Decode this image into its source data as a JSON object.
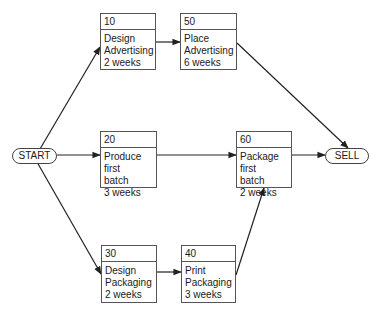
{
  "diagram": {
    "type": "PERT network",
    "start": "START",
    "end": "SELL",
    "activities": [
      {
        "id": "10",
        "name": "Design Advertising",
        "line1": "Design",
        "line2": "Advertising",
        "duration": "2 weeks"
      },
      {
        "id": "50",
        "name": "Place Advertising",
        "line1": "Place",
        "line2": "Advertising",
        "duration": "6 weeks"
      },
      {
        "id": "20",
        "name": "Produce first batch",
        "line1": "Produce first",
        "line2": "batch",
        "duration": "3 weeks"
      },
      {
        "id": "60",
        "name": "Package first batch",
        "line1": "Package first",
        "line2": "batch",
        "duration": "2 weeks"
      },
      {
        "id": "30",
        "name": "Design Packaging",
        "line1": "Design",
        "line2": "Packaging",
        "duration": "2 weeks"
      },
      {
        "id": "40",
        "name": "Print Packaging",
        "line1": "Print",
        "line2": "Packaging",
        "duration": "3 weeks"
      }
    ],
    "edges": [
      {
        "from": "START",
        "to": "10"
      },
      {
        "from": "START",
        "to": "20"
      },
      {
        "from": "START",
        "to": "30"
      },
      {
        "from": "10",
        "to": "50"
      },
      {
        "from": "20",
        "to": "60"
      },
      {
        "from": "30",
        "to": "40"
      },
      {
        "from": "40",
        "to": "60"
      },
      {
        "from": "50",
        "to": "SELL"
      },
      {
        "from": "60",
        "to": "SELL"
      }
    ]
  }
}
